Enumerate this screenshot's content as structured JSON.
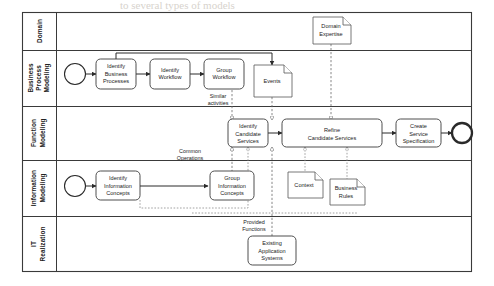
{
  "diagram": {
    "type": "bpmn-pool",
    "colors": {
      "stroke": "#3a3a3a",
      "task_fill": "#ffffff",
      "artifact_stroke": "#555555",
      "message_flow": "#6a6a6a",
      "association": "#8a8a8a",
      "background": "#ffffff"
    },
    "lanes": [
      {
        "id": "domain",
        "label": "Domain"
      },
      {
        "id": "bpm",
        "label": "Business\nProcess\nModeling",
        "lines": [
          "Business",
          "Process",
          "Modeling"
        ]
      },
      {
        "id": "fm",
        "label": "Function\nModeling",
        "lines": [
          "Function",
          "Modeling"
        ]
      },
      {
        "id": "im",
        "label": "Information\nModeling",
        "lines": [
          "Information",
          "Modeling"
        ]
      },
      {
        "id": "itr",
        "label": "IT\nRealization",
        "lines": [
          "IT",
          "Realization"
        ]
      }
    ],
    "tasks": [
      {
        "id": "identify-business-processes",
        "lane": "bpm",
        "lines": [
          "Identify",
          "Business",
          "Processes"
        ]
      },
      {
        "id": "identify-workflow",
        "lane": "bpm",
        "lines": [
          "Identify",
          "Workflow"
        ]
      },
      {
        "id": "group-workflow",
        "lane": "bpm",
        "lines": [
          "Group",
          "Workflow"
        ]
      },
      {
        "id": "identify-candidate-services",
        "lane": "fm",
        "lines": [
          "Identify",
          "Candidate",
          "Services"
        ]
      },
      {
        "id": "refine-candidate-services",
        "lane": "fm",
        "lines": [
          "Refine",
          "Candidate Services"
        ]
      },
      {
        "id": "create-service-specification",
        "lane": "fm",
        "lines": [
          "Create",
          "Service",
          "Specification"
        ]
      },
      {
        "id": "identify-information-concepts",
        "lane": "im",
        "lines": [
          "Identify",
          "Information",
          "Concepts"
        ]
      },
      {
        "id": "group-information-concepts",
        "lane": "im",
        "lines": [
          "Group",
          "Information",
          "Concepts"
        ]
      },
      {
        "id": "existing-application-systems",
        "lane": "itr",
        "lines": [
          "Existing",
          "Application",
          "Systems"
        ]
      }
    ],
    "artifacts": [
      {
        "id": "domain-expertise",
        "lane": "domain",
        "lines": [
          "Domain",
          "Expertise"
        ]
      },
      {
        "id": "events",
        "lane": "bpm",
        "lines": [
          "Events"
        ]
      },
      {
        "id": "context",
        "lane": "im",
        "lines": [
          "Context"
        ]
      },
      {
        "id": "business-rules",
        "lane": "im",
        "lines": [
          "Business",
          "Rules"
        ]
      }
    ],
    "events": [
      {
        "id": "start-event-bpm",
        "lane": "bpm",
        "kind": "start"
      },
      {
        "id": "start-event-im",
        "lane": "im",
        "kind": "start"
      },
      {
        "id": "end-event-fm",
        "lane": "fm",
        "kind": "end"
      }
    ],
    "flow_labels": [
      {
        "id": "similar-activities",
        "lines": [
          "Similar",
          "activities"
        ]
      },
      {
        "id": "common-operations",
        "lines": [
          "Common",
          "Operations"
        ]
      },
      {
        "id": "provided-functions",
        "lines": [
          "Provided",
          "Functions"
        ]
      }
    ]
  },
  "background_text": {
    "line1": "to several types of models",
    "line2": "and",
    "line3": "service",
    "line4": "process"
  }
}
